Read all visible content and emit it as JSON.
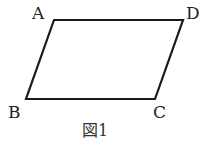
{
  "figure": {
    "caption": "図1",
    "shape": "parallelogram",
    "stroke_color": "#1a1a1a",
    "vertices": {
      "A": {
        "label": "A",
        "x": 54,
        "y": 20
      },
      "D": {
        "label": "D",
        "x": 183,
        "y": 20
      },
      "C": {
        "label": "C",
        "x": 155,
        "y": 99
      },
      "B": {
        "label": "B",
        "x": 26,
        "y": 99
      }
    }
  }
}
